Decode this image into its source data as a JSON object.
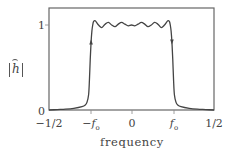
{
  "chart_data": {
    "type": "line",
    "title": "",
    "xlabel": "frequency",
    "ylabel": "|ĥ|",
    "xlim": [
      -0.5,
      0.5
    ],
    "ylim": [
      0,
      1.2
    ],
    "grid": false,
    "legend": null,
    "xticks": [
      {
        "value": -0.5,
        "label": "−1/2"
      },
      {
        "value": -0.25,
        "label": "−f_o"
      },
      {
        "value": 0,
        "label": "0"
      },
      {
        "value": 0.25,
        "label": "f_o"
      },
      {
        "value": 0.5,
        "label": "1/2"
      }
    ],
    "yticks": [
      {
        "value": 0,
        "label": "0"
      },
      {
        "value": 1,
        "label": "1"
      }
    ],
    "series": [
      {
        "name": "|ĥ| (low-pass filter magnitude response)",
        "x": [
          -0.5,
          -0.45,
          -0.4,
          -0.35,
          -0.3,
          -0.28,
          -0.27,
          -0.26,
          -0.255,
          -0.25,
          -0.245,
          -0.24,
          -0.235,
          -0.23,
          -0.22,
          -0.2,
          -0.18,
          -0.16,
          -0.14,
          -0.12,
          -0.1,
          -0.08,
          -0.06,
          -0.04,
          -0.02,
          0,
          0.02,
          0.04,
          0.06,
          0.08,
          0.1,
          0.12,
          0.14,
          0.16,
          0.18,
          0.2,
          0.22,
          0.23,
          0.235,
          0.24,
          0.245,
          0.25,
          0.255,
          0.26,
          0.27,
          0.28,
          0.3,
          0.35,
          0.4,
          0.45,
          0.5
        ],
        "y": [
          0.0,
          0.005,
          0.01,
          0.02,
          0.04,
          0.06,
          0.09,
          0.18,
          0.35,
          0.6,
          0.8,
          0.93,
          1.0,
          1.04,
          1.05,
          1.0,
          0.97,
          1.01,
          1.03,
          1.0,
          0.98,
          1.01,
          1.03,
          1.01,
          0.99,
          1.0,
          0.99,
          1.01,
          1.03,
          1.01,
          0.98,
          1.0,
          1.03,
          1.01,
          0.97,
          1.0,
          1.05,
          1.04,
          1.0,
          0.93,
          0.8,
          0.6,
          0.35,
          0.18,
          0.09,
          0.06,
          0.04,
          0.02,
          0.01,
          0.005,
          0.0
        ]
      }
    ],
    "annotations": [
      {
        "type": "arrow",
        "x": -0.245,
        "y": 0.8,
        "direction": "up"
      },
      {
        "type": "arrow",
        "x": 0.245,
        "y": 0.8,
        "direction": "down"
      }
    ]
  },
  "labels": {
    "x_ticks": [
      "−1/2",
      "−f",
      "0",
      "f",
      "1/2"
    ],
    "x_tick_sub": "o",
    "y_ticks": [
      "1",
      "0"
    ],
    "xlabel": "frequency",
    "ylabel_symbol": "h"
  }
}
